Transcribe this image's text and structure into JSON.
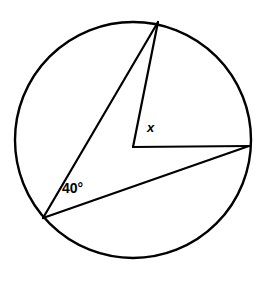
{
  "figure": {
    "kind": "circle-geometry-diagram",
    "background_color": "#ffffff",
    "stroke_color": "#000000",
    "canvas": {
      "width": 267,
      "height": 281
    }
  },
  "circle": {
    "center_x": 133,
    "center_y": 140,
    "radius": 118,
    "stroke_width": 2.4,
    "fill": "none"
  },
  "points": {
    "center": {
      "x": 133,
      "y": 147,
      "label": ""
    },
    "top": {
      "x": 158,
      "y": 22,
      "label": ""
    },
    "bottom_left": {
      "x": 43,
      "y": 218,
      "label": ""
    },
    "right": {
      "x": 249,
      "y": 146,
      "label": ""
    }
  },
  "segments": [
    {
      "name": "chord-bottomleft-to-top",
      "x1": 43,
      "y1": 218,
      "x2": 158,
      "y2": 22
    },
    {
      "name": "chord-bottomleft-to-right",
      "x1": 43,
      "y1": 218,
      "x2": 249,
      "y2": 146
    },
    {
      "name": "radius-center-to-top",
      "x1": 133,
      "y1": 147,
      "x2": 158,
      "y2": 22
    },
    {
      "name": "radius-center-to-right",
      "x1": 133,
      "y1": 147,
      "x2": 249,
      "y2": 146
    }
  ],
  "labels": {
    "inscribed_angle": "40°",
    "central_angle": "x"
  }
}
